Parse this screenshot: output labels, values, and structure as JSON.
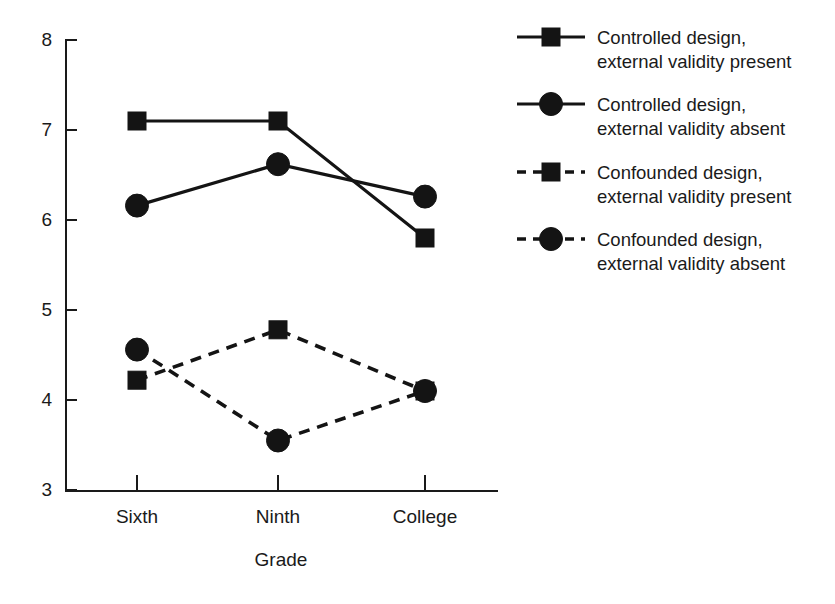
{
  "chart_data": {
    "type": "line",
    "title": "",
    "subtitle": "",
    "xlabel": "Grade",
    "ylabel": "",
    "categories": [
      "Sixth",
      "Ninth",
      "College"
    ],
    "ylim": [
      3,
      8
    ],
    "yticks": [
      3,
      4,
      5,
      6,
      7,
      8
    ],
    "ytick_labels": [
      "3",
      "4",
      "5",
      "6",
      "7",
      "8"
    ],
    "grid": false,
    "legend_position": "right",
    "series": [
      {
        "name": "Controlled design, external validity present",
        "label_line1": "Controlled design,",
        "label_line2": "external validity present",
        "marker": "square",
        "linestyle": "solid",
        "color": "#141414",
        "values": [
          7.1,
          7.1,
          5.8
        ]
      },
      {
        "name": "Controlled design, external validity absent",
        "label_line1": "Controlled design,",
        "label_line2": "external validity absent",
        "marker": "circle",
        "linestyle": "solid",
        "color": "#141414",
        "values": [
          6.16,
          6.62,
          6.26
        ]
      },
      {
        "name": "Confounded design, external validity present",
        "label_line1": "Confounded design,",
        "label_line2": "external validity present",
        "marker": "square",
        "linestyle": "dashed",
        "color": "#141414",
        "values": [
          4.22,
          4.78,
          4.1
        ]
      },
      {
        "name": "Confounded design, external validity absent",
        "label_line1": "Confounded design,",
        "label_line2": "external validity absent",
        "marker": "circle",
        "linestyle": "dashed",
        "color": "#141414",
        "values": [
          4.56,
          3.55,
          4.1
        ]
      }
    ]
  },
  "axis": {
    "y_labels": [
      "8",
      "7",
      "6",
      "5",
      "4",
      "3"
    ],
    "x_labels": [
      "Sixth",
      "Ninth",
      "College"
    ],
    "x_title": "Grade"
  },
  "legend": {
    "entries": [
      {
        "line1": "Controlled design,",
        "line2": "external validity present",
        "marker": "square",
        "style": "solid"
      },
      {
        "line1": "Controlled design,",
        "line2": "external validity absent",
        "marker": "circle",
        "style": "solid"
      },
      {
        "line1": "Confounded design,",
        "line2": "external validity present",
        "marker": "square",
        "style": "dashed"
      },
      {
        "line1": "Confounded design,",
        "line2": "external validity absent",
        "marker": "circle",
        "style": "dashed"
      }
    ]
  }
}
